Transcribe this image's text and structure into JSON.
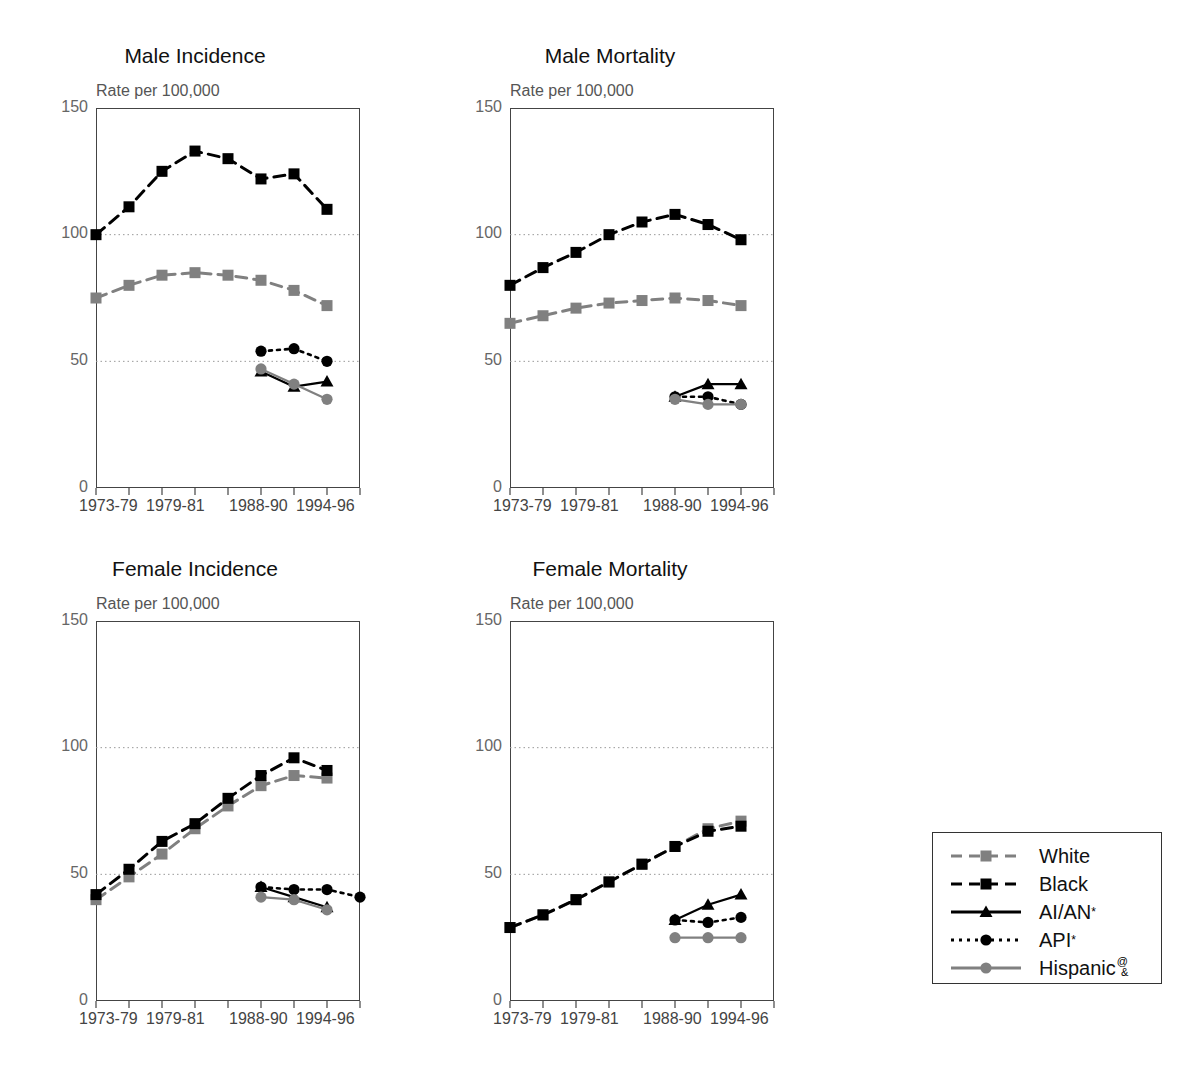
{
  "figure": {
    "panels": [
      {
        "key": "male_incidence",
        "title": "Male Incidence",
        "axis_caption": "Rate per 100,000"
      },
      {
        "key": "male_mortality",
        "title": "Male Mortality",
        "axis_caption": "Rate per 100,000"
      },
      {
        "key": "female_incidence",
        "title": "Female Incidence",
        "axis_caption": "Rate per 100,000"
      },
      {
        "key": "female_mortality",
        "title": "Female Mortality",
        "axis_caption": "Rate per 100,000"
      }
    ],
    "y_ticks": [
      "150",
      "100",
      "50",
      "0"
    ],
    "x_tick_labels": [
      "1973-79",
      "1979-81",
      "1988-90",
      "1994-96"
    ],
    "legend": {
      "entries": [
        {
          "label": "White",
          "marker": "square",
          "line": "dashed",
          "color": "#808080"
        },
        {
          "label": "Black",
          "marker": "square",
          "line": "dashed",
          "color": "#000000"
        },
        {
          "label": "AI/AN",
          "sup": "*",
          "marker": "triangle",
          "line": "solid",
          "color": "#000000"
        },
        {
          "label": "API",
          "sup": "*",
          "marker": "circle",
          "line": "dotted",
          "color": "#000000"
        },
        {
          "label": "Hispanic",
          "sup": "@",
          "sub": "&",
          "marker": "circle",
          "line": "solid",
          "color": "#808080"
        }
      ]
    },
    "bottom_caption": ""
  },
  "chart_data": [
    {
      "type": "line",
      "key": "male_incidence",
      "title": "Male Incidence",
      "xlabel": "",
      "ylabel": "Rate per 100,000",
      "ylim": [
        0,
        150
      ],
      "yticks": [
        0,
        50,
        100,
        150
      ],
      "grid": "horizontal-dotted-at-50-100",
      "legend_position": "outside-right-bottom",
      "x": [
        "1973-75",
        "1976-78",
        "1979-81",
        "1982-84",
        "1985-87",
        "1988-90",
        "1991-93",
        "1994-96",
        "1997-99"
      ],
      "x_tick_labels": [
        "1973-79",
        "1979-81",
        "1988-90",
        "1994-96"
      ],
      "series": [
        {
          "name": "White",
          "values": [
            75,
            80,
            84,
            85,
            84,
            82,
            78,
            72,
            null
          ],
          "style": "dashed",
          "marker": "square",
          "color": "#808080"
        },
        {
          "name": "Black",
          "values": [
            100,
            111,
            125,
            133,
            130,
            122,
            124,
            110,
            null
          ],
          "style": "dashed",
          "marker": "square",
          "color": "#000000"
        },
        {
          "name": "AI/AN",
          "values": [
            null,
            null,
            null,
            null,
            null,
            46,
            40,
            42,
            null
          ],
          "style": "solid",
          "marker": "triangle",
          "color": "#000000"
        },
        {
          "name": "API",
          "values": [
            null,
            null,
            null,
            null,
            null,
            54,
            55,
            50,
            null
          ],
          "style": "dotted",
          "marker": "circle",
          "color": "#000000"
        },
        {
          "name": "Hispanic",
          "values": [
            null,
            null,
            null,
            null,
            null,
            47,
            41,
            35,
            null
          ],
          "style": "solid",
          "marker": "circle",
          "color": "#808080"
        }
      ]
    },
    {
      "type": "line",
      "key": "male_mortality",
      "title": "Male Mortality",
      "xlabel": "",
      "ylabel": "Rate per 100,000",
      "ylim": [
        0,
        150
      ],
      "yticks": [
        0,
        50,
        100,
        150
      ],
      "grid": "horizontal-dotted-at-50-100",
      "x": [
        "1973-75",
        "1976-78",
        "1979-81",
        "1982-84",
        "1985-87",
        "1988-90",
        "1991-93",
        "1994-96",
        "1997-99"
      ],
      "x_tick_labels": [
        "1973-79",
        "1979-81",
        "1988-90",
        "1994-96"
      ],
      "series": [
        {
          "name": "White",
          "values": [
            65,
            68,
            71,
            73,
            74,
            75,
            74,
            72,
            null
          ],
          "style": "dashed",
          "marker": "square",
          "color": "#808080"
        },
        {
          "name": "Black",
          "values": [
            80,
            87,
            93,
            100,
            105,
            108,
            104,
            98,
            null
          ],
          "style": "dashed",
          "marker": "square",
          "color": "#000000"
        },
        {
          "name": "AI/AN",
          "values": [
            null,
            null,
            null,
            null,
            null,
            36,
            41,
            41,
            null
          ],
          "style": "solid",
          "marker": "triangle",
          "color": "#000000"
        },
        {
          "name": "API",
          "values": [
            null,
            null,
            null,
            null,
            null,
            36,
            36,
            33,
            null
          ],
          "style": "dotted",
          "marker": "circle",
          "color": "#000000"
        },
        {
          "name": "Hispanic",
          "values": [
            null,
            null,
            null,
            null,
            null,
            35,
            33,
            33,
            null
          ],
          "style": "solid",
          "marker": "circle",
          "color": "#808080"
        }
      ]
    },
    {
      "type": "line",
      "key": "female_incidence",
      "title": "Female Incidence",
      "xlabel": "",
      "ylabel": "Rate per 100,000",
      "ylim": [
        0,
        150
      ],
      "yticks": [
        0,
        50,
        100,
        150
      ],
      "grid": "horizontal-dotted-at-50-100",
      "x": [
        "1973-75",
        "1976-78",
        "1979-81",
        "1982-84",
        "1985-87",
        "1988-90",
        "1991-93",
        "1994-96",
        "1997-99"
      ],
      "x_tick_labels": [
        "1973-79",
        "1979-81",
        "1988-90",
        "1994-96"
      ],
      "series": [
        {
          "name": "White",
          "values": [
            40,
            49,
            58,
            68,
            77,
            85,
            89,
            88,
            null
          ],
          "style": "dashed",
          "marker": "square",
          "color": "#808080"
        },
        {
          "name": "Black",
          "values": [
            42,
            52,
            63,
            70,
            80,
            89,
            96,
            91,
            null
          ],
          "style": "dashed",
          "marker": "square",
          "color": "#000000"
        },
        {
          "name": "AI/AN",
          "values": [
            null,
            null,
            null,
            null,
            null,
            45,
            41,
            37,
            null
          ],
          "style": "solid",
          "marker": "triangle",
          "color": "#000000"
        },
        {
          "name": "API",
          "values": [
            null,
            null,
            null,
            null,
            null,
            45,
            44,
            44,
            41
          ],
          "style": "dotted",
          "marker": "circle",
          "color": "#000000"
        },
        {
          "name": "Hispanic",
          "values": [
            null,
            null,
            null,
            null,
            null,
            41,
            40,
            36,
            null
          ],
          "style": "solid",
          "marker": "circle",
          "color": "#808080"
        }
      ]
    },
    {
      "type": "line",
      "key": "female_mortality",
      "title": "Female Mortality",
      "xlabel": "",
      "ylabel": "Rate per 100,000",
      "ylim": [
        0,
        150
      ],
      "yticks": [
        0,
        50,
        100,
        150
      ],
      "grid": "horizontal-dotted-at-50-100",
      "x": [
        "1973-75",
        "1976-78",
        "1979-81",
        "1982-84",
        "1985-87",
        "1988-90",
        "1991-93",
        "1994-96",
        "1997-99"
      ],
      "x_tick_labels": [
        "1973-79",
        "1979-81",
        "1988-90",
        "1994-96"
      ],
      "series": [
        {
          "name": "White",
          "values": [
            29,
            34,
            40,
            47,
            54,
            61,
            68,
            71,
            null
          ],
          "style": "dashed",
          "marker": "square",
          "color": "#808080"
        },
        {
          "name": "Black",
          "values": [
            29,
            34,
            40,
            47,
            54,
            61,
            67,
            69,
            null
          ],
          "style": "dashed",
          "marker": "square",
          "color": "#000000"
        },
        {
          "name": "AI/AN",
          "values": [
            null,
            null,
            null,
            null,
            null,
            32,
            38,
            42,
            null
          ],
          "style": "solid",
          "marker": "triangle",
          "color": "#000000"
        },
        {
          "name": "API",
          "values": [
            null,
            null,
            null,
            null,
            null,
            32,
            31,
            33,
            null
          ],
          "style": "dotted",
          "marker": "circle",
          "color": "#000000"
        },
        {
          "name": "Hispanic",
          "values": [
            null,
            null,
            null,
            null,
            null,
            25,
            25,
            25,
            null
          ],
          "style": "solid",
          "marker": "circle",
          "color": "#808080"
        }
      ]
    }
  ]
}
